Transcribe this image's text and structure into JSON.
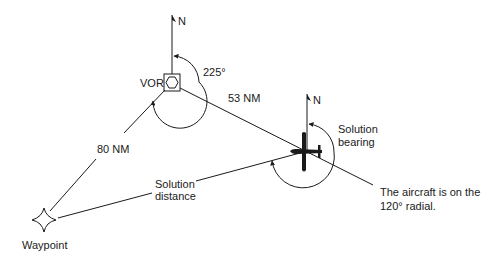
{
  "diagram": {
    "colors": {
      "ink": "#1a1a1a",
      "background": "#ffffff"
    },
    "labels": {
      "vor": "VOR",
      "north_vor": "N",
      "north_aircraft": "N",
      "radial_angle": "225°",
      "vor_to_aircraft_distance": "53 NM",
      "waypoint_to_vor_distance": "80 NM",
      "solution_bearing_line1": "Solution",
      "solution_bearing_line2": "bearing",
      "solution_distance_line1": "Solution",
      "solution_distance_line2": "distance",
      "aircraft_note_line1": "The aircraft is on the",
      "aircraft_note_line2": "120° radial.",
      "waypoint": "Waypoint"
    },
    "icons": {
      "vor": "vor-station-icon",
      "aircraft": "aircraft-icon",
      "waypoint": "waypoint-star-icon"
    }
  }
}
